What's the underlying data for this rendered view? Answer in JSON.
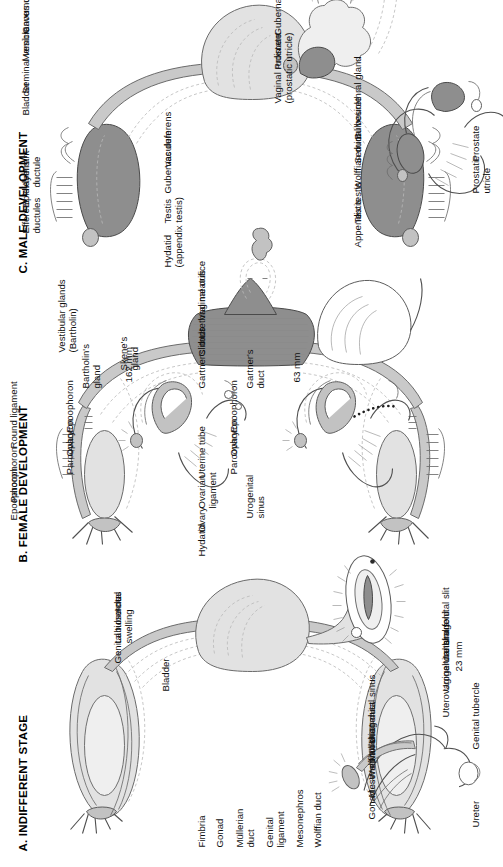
{
  "figure": {
    "caption_rotation_deg": -90,
    "colors": {
      "ink": "#4f4f4f",
      "ghost": "#b9b9b9",
      "organ_light": "#e2e2e2",
      "organ_mid": "#c2c2c2",
      "organ_dark": "#8e8e8e",
      "background": "#ffffff"
    }
  },
  "panels": [
    {
      "id": "a",
      "title": "A.  INDIFFERENT STAGE",
      "labels": [
        "Fimbria",
        "Gonad",
        "Müllerian\nduct",
        "Genital\nligament",
        "Mesonephros",
        "Wolffian duct",
        "Bladder",
        "Uterovaginal canal",
        "Urogenital sinus",
        "Urethral fold",
        "Urogenital slit",
        "Genital tubercle",
        "Labioscrotal\nswelling",
        "Anus"
      ],
      "inset": {
        "scale": "23 mm",
        "labels": [
          "Gonad",
          "Mesonephros",
          "Wolffian duct",
          "Müllerian duct",
          "Urogenital sinus",
          "Ureter",
          "Genital tubercle"
        ]
      }
    },
    {
      "id": "b",
      "title": "B.  FEMALE DEVELOPMENT",
      "labels": [
        "Hydatid",
        "Ovary",
        "Ovarian\nligament",
        "Uterine tube",
        "Epoophoron",
        "Paroophoron",
        "Round ligament",
        "Gartner's duct",
        "Clitoris",
        "Urethral meatus",
        "Vaginal orifice",
        "Vestibular glands\n(Bartholin)"
      ],
      "insets": [
        {
          "scale": "63 mm",
          "labels": [
            "Ovary",
            "Epoophoron",
            "Paroophoron",
            "Gartner's\nduct",
            "Urogenital\nsinus"
          ]
        },
        {
          "scale": "162 mm",
          "labels": [
            "Ovary",
            "Epoophoron",
            "Paroophoron",
            "Bartholin's\ngland",
            "Skene's\ngland"
          ]
        }
      ]
    },
    {
      "id": "c",
      "title": "C.  MALE DEVELOPMENT",
      "labels": [
        "Hydatid\n(appendix testis)",
        "Efferent\nductules",
        "Epididymis",
        "Aberrant\nductule",
        "Testis",
        "Gubernaculum",
        "Vas deferens",
        "Bladder",
        "Seminal vesicle",
        "Membranous urethra",
        "Cavernous urethra",
        "Vaginal rudiment\n(prostatic utricle)",
        "Prostate",
        "Gubernaculum"
      ],
      "inset": {
        "labels": [
          "Appendix testis",
          "Testis",
          "Wolffian duct",
          "Seminal vesicle",
          "Bulbourethral gland",
          "Prostatic\nutricle",
          "Prostate"
        ]
      }
    }
  ]
}
